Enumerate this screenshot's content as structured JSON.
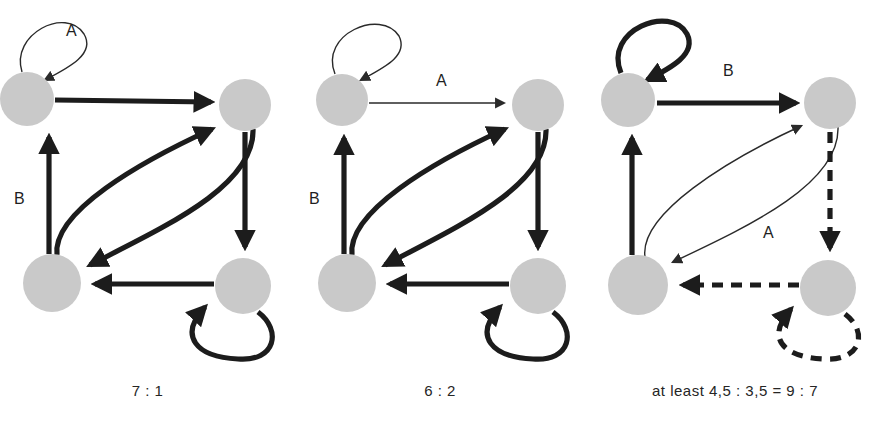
{
  "diagram": {
    "node_color": "#c9c9c9",
    "edge_color": "#1c1c1c",
    "panels": [
      {
        "id": "graph-1",
        "caption": "7 : 1",
        "nodes": [
          {
            "id": "n1",
            "label": "",
            "cx": 27,
            "cy": 99,
            "r": 27
          },
          {
            "id": "n2",
            "label": "",
            "cx": 245,
            "cy": 105,
            "r": 26
          },
          {
            "id": "n3",
            "label": "",
            "cx": 52,
            "cy": 283,
            "r": 29
          },
          {
            "id": "n4",
            "label": "",
            "cx": 243,
            "cy": 286,
            "r": 28
          }
        ],
        "edges": [
          {
            "from": "n1",
            "to": "n1",
            "style": "thin",
            "kind": "self-loop",
            "label": "A"
          },
          {
            "from": "n1",
            "to": "n2",
            "style": "thick",
            "kind": "straight",
            "label": ""
          },
          {
            "from": "n3",
            "to": "n1",
            "style": "thick",
            "kind": "straight",
            "label": "B"
          },
          {
            "from": "n3",
            "to": "n2",
            "style": "thick",
            "kind": "curve",
            "label": ""
          },
          {
            "from": "n2",
            "to": "n3",
            "style": "thick",
            "kind": "curve",
            "label": ""
          },
          {
            "from": "n2",
            "to": "n4",
            "style": "thick",
            "kind": "straight",
            "label": ""
          },
          {
            "from": "n4",
            "to": "n3",
            "style": "thick",
            "kind": "straight",
            "label": ""
          },
          {
            "from": "n4",
            "to": "n4",
            "style": "thick",
            "kind": "self-loop",
            "label": ""
          }
        ],
        "labels": [
          {
            "text": "A",
            "x": 72,
            "y": 30
          },
          {
            "text": "B",
            "x": 22,
            "y": 203
          }
        ]
      },
      {
        "id": "graph-2",
        "caption": "6 : 2",
        "nodes": [
          {
            "id": "n1",
            "label": "",
            "cx": 47,
            "cy": 100,
            "r": 26
          },
          {
            "id": "n2",
            "label": "",
            "cx": 243,
            "cy": 105,
            "r": 26
          },
          {
            "id": "n3",
            "label": "",
            "cx": 52,
            "cy": 283,
            "r": 29
          },
          {
            "id": "n4",
            "label": "",
            "cx": 243,
            "cy": 286,
            "r": 28
          }
        ],
        "edges": [
          {
            "from": "n1",
            "to": "n1",
            "style": "thin",
            "kind": "self-loop",
            "label": ""
          },
          {
            "from": "n1",
            "to": "n2",
            "style": "thin",
            "kind": "straight",
            "label": "A"
          },
          {
            "from": "n3",
            "to": "n1",
            "style": "thick",
            "kind": "straight",
            "label": "B"
          },
          {
            "from": "n3",
            "to": "n2",
            "style": "thick",
            "kind": "curve",
            "label": ""
          },
          {
            "from": "n2",
            "to": "n3",
            "style": "thick",
            "kind": "curve",
            "label": ""
          },
          {
            "from": "n2",
            "to": "n4",
            "style": "thick",
            "kind": "straight",
            "label": ""
          },
          {
            "from": "n4",
            "to": "n3",
            "style": "thick",
            "kind": "straight",
            "label": ""
          },
          {
            "from": "n4",
            "to": "n4",
            "style": "thick",
            "kind": "self-loop",
            "label": ""
          }
        ],
        "labels": [
          {
            "text": "A",
            "x": 148,
            "y": 82
          },
          {
            "text": "B",
            "x": 22,
            "y": 203
          }
        ]
      },
      {
        "id": "graph-3",
        "caption": "at least 4,5 : 3,5 = 9 : 7",
        "nodes": [
          {
            "id": "n1",
            "label": "",
            "cx": 43,
            "cy": 100,
            "r": 27
          },
          {
            "id": "n2",
            "label": "",
            "cx": 245,
            "cy": 103,
            "r": 26
          },
          {
            "id": "n3",
            "label": "",
            "cx": 53,
            "cy": 285,
            "r": 30
          },
          {
            "id": "n4",
            "label": "",
            "cx": 243,
            "cy": 288,
            "r": 28
          }
        ],
        "edges": [
          {
            "from": "n1",
            "to": "n1",
            "style": "thick",
            "kind": "self-loop",
            "label": ""
          },
          {
            "from": "n1",
            "to": "n2",
            "style": "thick",
            "kind": "straight",
            "label": "B"
          },
          {
            "from": "n3",
            "to": "n1",
            "style": "thick",
            "kind": "straight",
            "label": ""
          },
          {
            "from": "n3",
            "to": "n2",
            "style": "thin",
            "kind": "curve",
            "label": ""
          },
          {
            "from": "n2",
            "to": "n3",
            "style": "thin",
            "kind": "curve",
            "label": "A"
          },
          {
            "from": "n2",
            "to": "n4",
            "style": "dashed",
            "kind": "straight",
            "label": ""
          },
          {
            "from": "n4",
            "to": "n3",
            "style": "dashed",
            "kind": "straight",
            "label": ""
          },
          {
            "from": "n4",
            "to": "n4",
            "style": "dashed",
            "kind": "self-loop",
            "label": ""
          }
        ],
        "labels": [
          {
            "text": "B",
            "x": 145,
            "y": 72
          },
          {
            "text": "A",
            "x": 185,
            "y": 232
          }
        ]
      }
    ]
  }
}
